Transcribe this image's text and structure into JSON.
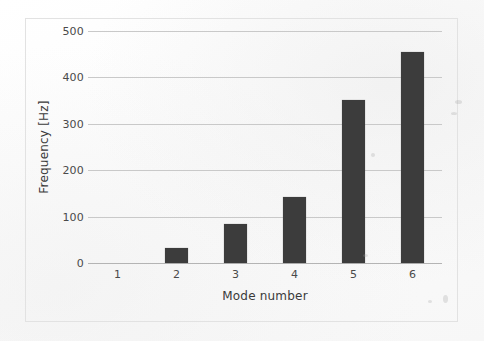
{
  "chart_data": {
    "type": "bar",
    "title": "",
    "xlabel": "Mode number",
    "ylabel": "Frequency [Hz]",
    "categories": [
      "1",
      "2",
      "3",
      "4",
      "5",
      "6"
    ],
    "values": [
      0,
      32,
      85,
      142,
      352,
      455
    ],
    "series": [
      {
        "name": "Frequency",
        "values": [
          0,
          32,
          85,
          142,
          352,
          455
        ]
      }
    ],
    "ylim": [
      0,
      500
    ],
    "yticks": [
      0,
      100,
      200,
      300,
      400,
      500
    ],
    "ytick_labels": [
      "0",
      "100",
      "200",
      "300",
      "400",
      "500"
    ],
    "xtick_labels": [
      "1",
      "2",
      "3",
      "4",
      "5",
      "6"
    ],
    "grid": "horizontal",
    "legend": "none",
    "bar_color": "#3c3c3c",
    "gridline_color": "#c9c9c9",
    "axis_color": "#b4b4b4",
    "background_color": "#fdfdfd",
    "frame_color": "#e2e2e2"
  }
}
